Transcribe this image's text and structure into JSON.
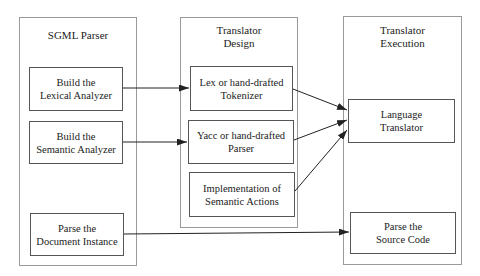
{
  "columns": [
    {
      "id": "sgml-parser",
      "title": [
        "SGML Parser"
      ],
      "boxes": [
        {
          "id": "build-lexical",
          "lines": [
            "Build the",
            "Lexical Analyzer"
          ]
        },
        {
          "id": "build-semantic",
          "lines": [
            "Build the",
            "Semantic Analyzer"
          ]
        },
        {
          "id": "parse-document",
          "lines": [
            "Parse the",
            "Document Instance"
          ]
        }
      ]
    },
    {
      "id": "translator-design",
      "title": [
        "Translator",
        "Design"
      ],
      "boxes": [
        {
          "id": "lex-tokenizer",
          "lines": [
            "Lex or hand-drafted",
            "Tokenizer"
          ]
        },
        {
          "id": "yacc-parser",
          "lines": [
            "Yacc or hand-drafted",
            "Parser"
          ]
        },
        {
          "id": "semantic-actions",
          "lines": [
            "Implementation of",
            "Semantic Actions"
          ]
        }
      ]
    },
    {
      "id": "translator-execution",
      "title": [
        "Translator",
        "Execution"
      ],
      "boxes": [
        {
          "id": "language-translator",
          "lines": [
            "Language",
            "Translator"
          ]
        },
        {
          "id": "parse-source",
          "lines": [
            "Parse the",
            "Source Code"
          ]
        }
      ]
    }
  ],
  "edges": [
    {
      "from": "build-lexical",
      "to": "lex-tokenizer"
    },
    {
      "from": "build-semantic",
      "to": "yacc-parser"
    },
    {
      "from": "lex-tokenizer",
      "to": "language-translator"
    },
    {
      "from": "yacc-parser",
      "to": "language-translator"
    },
    {
      "from": "semantic-actions",
      "to": "language-translator"
    },
    {
      "from": "parse-document",
      "to": "parse-source"
    }
  ],
  "colors": {
    "outer_border": "#9a9a9a",
    "inner_border": "#555555",
    "arrow": "#222222",
    "text": "#222222"
  }
}
